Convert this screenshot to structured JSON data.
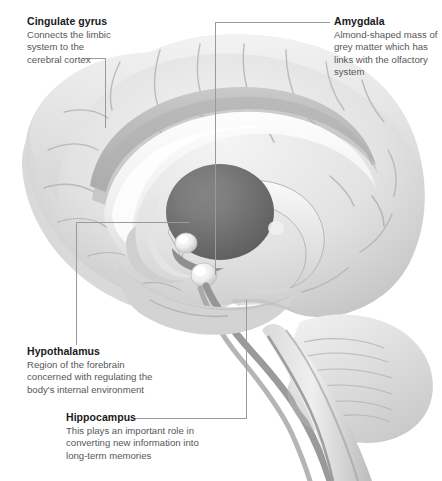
{
  "figure": {
    "style": "grayscale medical illustration",
    "width": 442,
    "height": 481,
    "background_color": "#ffffff",
    "leader_line_color": "#9a9a9a",
    "title_color": "#1a1a1a",
    "body_color": "#575757",
    "brain_tones": {
      "cortex_light": "#e9e9e9",
      "cortex_mid": "#cfcfcf",
      "cortex_shadow": "#b0b0b0",
      "corpus_callosum": "#f5f5f5",
      "cingulate_band": "#bdbdbd",
      "thalamus_dark": "#6f6f6f",
      "highlight": "#fbfbfb",
      "brainstem": "#8c8c8c"
    }
  },
  "callouts": [
    {
      "id": "cingulate",
      "title": "Cingulate gyrus",
      "lines": [
        "Connects the limbic",
        "system to the",
        "cerebral cortex"
      ]
    },
    {
      "id": "amygdala",
      "title": "Amygdala",
      "lines": [
        "Almond-shaped mass of",
        "grey matter which has",
        "links with the olfactory",
        "system"
      ]
    },
    {
      "id": "hypothalamus",
      "title": "Hypothalamus",
      "lines": [
        "Region of the forebrain",
        "concerned with regulating the",
        "body's internal environment"
      ]
    },
    {
      "id": "hippocampus",
      "title": "Hippocampus",
      "lines": [
        "This plays an important role in",
        "converting new information into",
        "long-term memories"
      ]
    }
  ]
}
